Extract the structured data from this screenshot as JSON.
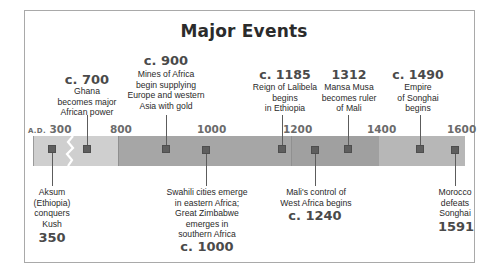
{
  "title": "Major Events",
  "axis": {
    "prefix": "A.D.",
    "ticks": [
      "300",
      "800",
      "1000",
      "1200",
      "1400",
      "1600"
    ]
  },
  "colors": {
    "segment_early": "#cfcfcf",
    "segment_middle": "#a6a6a6",
    "segment_middle_right": "#a0a0a0",
    "segment_late": "#b7b7b7",
    "marker": "#5e5e5e",
    "frame_border": "#a9a9a9"
  },
  "events_above": [
    {
      "year": "c. 700",
      "description": [
        "Ghana",
        "becomes major",
        "African power"
      ]
    },
    {
      "year": "c. 900",
      "description": [
        "Mines of Africa",
        "begin supplying",
        "Europe and western",
        "Asia with gold"
      ]
    },
    {
      "year": "c. 1185",
      "description": [
        "Reign of Lalibela",
        "begins",
        "in Ethiopia"
      ]
    },
    {
      "year": "1312",
      "description": [
        "Mansa Musa",
        "becomes ruler",
        "of Mali"
      ]
    },
    {
      "year": "c. 1490",
      "description": [
        "Empire",
        "of Songhai",
        "begins"
      ]
    }
  ],
  "events_below": [
    {
      "year": "350",
      "description": [
        "Aksum",
        "(Ethiopia)",
        "conquers",
        "Kush"
      ]
    },
    {
      "year": "c. 1000",
      "description": [
        "Swahili cities emerge",
        "in eastern Africa;",
        "Great Zimbabwe",
        "emerges in",
        "southern Africa"
      ]
    },
    {
      "year": "c. 1240",
      "description": [
        "Mali's control of",
        "West Africa begins"
      ]
    },
    {
      "year": "1591",
      "description": [
        "Morocco",
        "defeats",
        "Songhai"
      ]
    }
  ]
}
